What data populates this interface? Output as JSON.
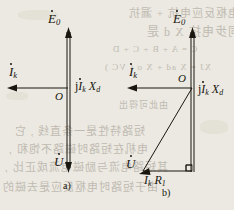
{
  "figure": {
    "type": "phasor-diagram",
    "background_color": "#ece9e2",
    "ink_color": "#18160f",
    "panels": [
      {
        "id": "a",
        "caption": "a)",
        "labels": {
          "emf": "E",
          "emf_sub": "0",
          "current": "I",
          "current_sub": "k",
          "reactance_drop": "j",
          "reactance_drop_current": "I",
          "reactance_drop_current_sub": "k",
          "reactance_drop_x": "X",
          "reactance_drop_x_sub": "d",
          "origin": "O",
          "voltage": "U"
        },
        "phasors": [
          {
            "name": "E0",
            "from": [
              68,
              170
            ],
            "to": [
              68,
              30
            ],
            "style": "double-line",
            "arrow": "up"
          },
          {
            "name": "Ik",
            "from": [
              68,
              88
            ],
            "to": [
              10,
              88
            ],
            "style": "single-line",
            "arrow": "left"
          },
          {
            "name": "U",
            "from": [
              68,
              30
            ],
            "to": [
              68,
              170
            ],
            "style": "double-line",
            "arrow": "down"
          }
        ]
      },
      {
        "id": "b",
        "caption": "b)",
        "labels": {
          "emf": "E",
          "emf_sub": "0",
          "current": "I",
          "current_sub": "k",
          "reactance_drop": "j",
          "reactance_drop_current": "I",
          "reactance_drop_current_sub": "k",
          "reactance_drop_x": "X",
          "reactance_drop_x_sub": "d",
          "origin": "O",
          "voltage": "U",
          "resistance_drop_current": "I",
          "resistance_drop_current_sub": "k",
          "resistance_drop_r": "R",
          "resistance_drop_r_sub": "1"
        },
        "phasors": [
          {
            "name": "E0",
            "from": [
              192,
              176
            ],
            "to": [
              192,
              30
            ],
            "style": "double-line",
            "arrow": "up"
          },
          {
            "name": "Ik",
            "from": [
              192,
              88
            ],
            "to": [
              130,
              88
            ],
            "style": "single-line",
            "arrow": "left"
          },
          {
            "name": "U",
            "from": [
              192,
              88
            ],
            "to": [
              142,
              172
            ],
            "style": "single-line",
            "arrow": "down-left"
          },
          {
            "name": "IkR1",
            "from": [
              142,
              172
            ],
            "to": [
              192,
              172
            ],
            "style": "single-line",
            "arrow": "right"
          }
        ],
        "right_angle_marker": {
          "at": [
            192,
            172
          ],
          "size": 6
        }
      }
    ]
  },
  "bleed_through_text": {
    "note": "faint mirrored text from the reverse side of the scanned page",
    "lines": [
      "电枢反应电抗 + 漏抗",
      "同步电抗 X d 是",
      "C = A + B + C + D",
      "XJ = X ad + X σ ( VC )",
      "由此可得出",
      "短路特性是一条直线 , 它",
      "电机在短路时磁路不饱和 ,",
      "其短路电流与励磁电流成正比 ,",
      "由于短路时电枢反应是去磁的"
    ]
  }
}
